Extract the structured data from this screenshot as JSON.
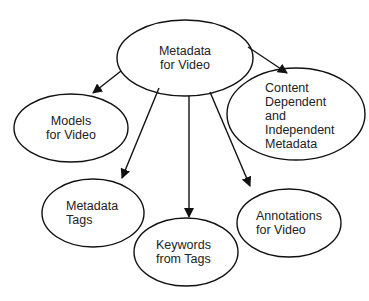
{
  "nodes": {
    "root": {
      "label": "Metadata\nfor Video"
    },
    "models": {
      "label": "Models\nfor Video"
    },
    "content": {
      "label": "Content\nDependent\nand\nIndependent\nMetadata"
    },
    "tags": {
      "label": "Metadata\nTags"
    },
    "keywords": {
      "label": "Keywords\nfrom Tags"
    },
    "annotations": {
      "label": "Annotations\nfor Video"
    }
  },
  "edges": [
    {
      "from": "root",
      "to": "models"
    },
    {
      "from": "root",
      "to": "content"
    },
    {
      "from": "root",
      "to": "tags"
    },
    {
      "from": "root",
      "to": "keywords"
    },
    {
      "from": "root",
      "to": "annotations"
    }
  ]
}
